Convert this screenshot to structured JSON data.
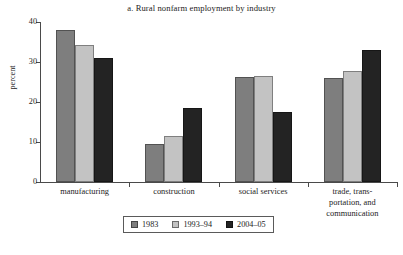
{
  "chart_data": {
    "type": "bar",
    "title": "a. Rural nonfarm employment by industry",
    "xlabel": "",
    "ylabel": "percent",
    "ylim": [
      0,
      40
    ],
    "yticks": [
      0,
      10,
      20,
      30,
      40
    ],
    "ytick_labels": [
      "0",
      "10",
      "20",
      "30",
      "40"
    ],
    "grid": false,
    "legend_position": "bottom",
    "categories": [
      "manufacturing",
      "construction",
      "social services",
      "trade, trans-\nportation, and\ncommunication"
    ],
    "category_labels_flat": [
      "manufacturing",
      "construction",
      "social services",
      "trade, transportation, and communication"
    ],
    "series": [
      {
        "name": "1983",
        "color": "#7e7e7e",
        "values": [
          38.0,
          9.5,
          26.3,
          26.0
        ]
      },
      {
        "name": "1993–94",
        "color": "#c3c3c3",
        "values": [
          34.2,
          11.4,
          26.6,
          27.7
        ]
      },
      {
        "name": "2004–05",
        "color": "#232323",
        "values": [
          31.0,
          18.4,
          17.5,
          33.0
        ]
      }
    ]
  },
  "legend": {
    "entries": [
      {
        "label": "1983"
      },
      {
        "label": "1993–94"
      },
      {
        "label": "2004–05"
      }
    ]
  },
  "axis": {
    "y_label": "percent",
    "y_ticks": [
      "40",
      "30",
      "20",
      "10",
      "0"
    ]
  }
}
